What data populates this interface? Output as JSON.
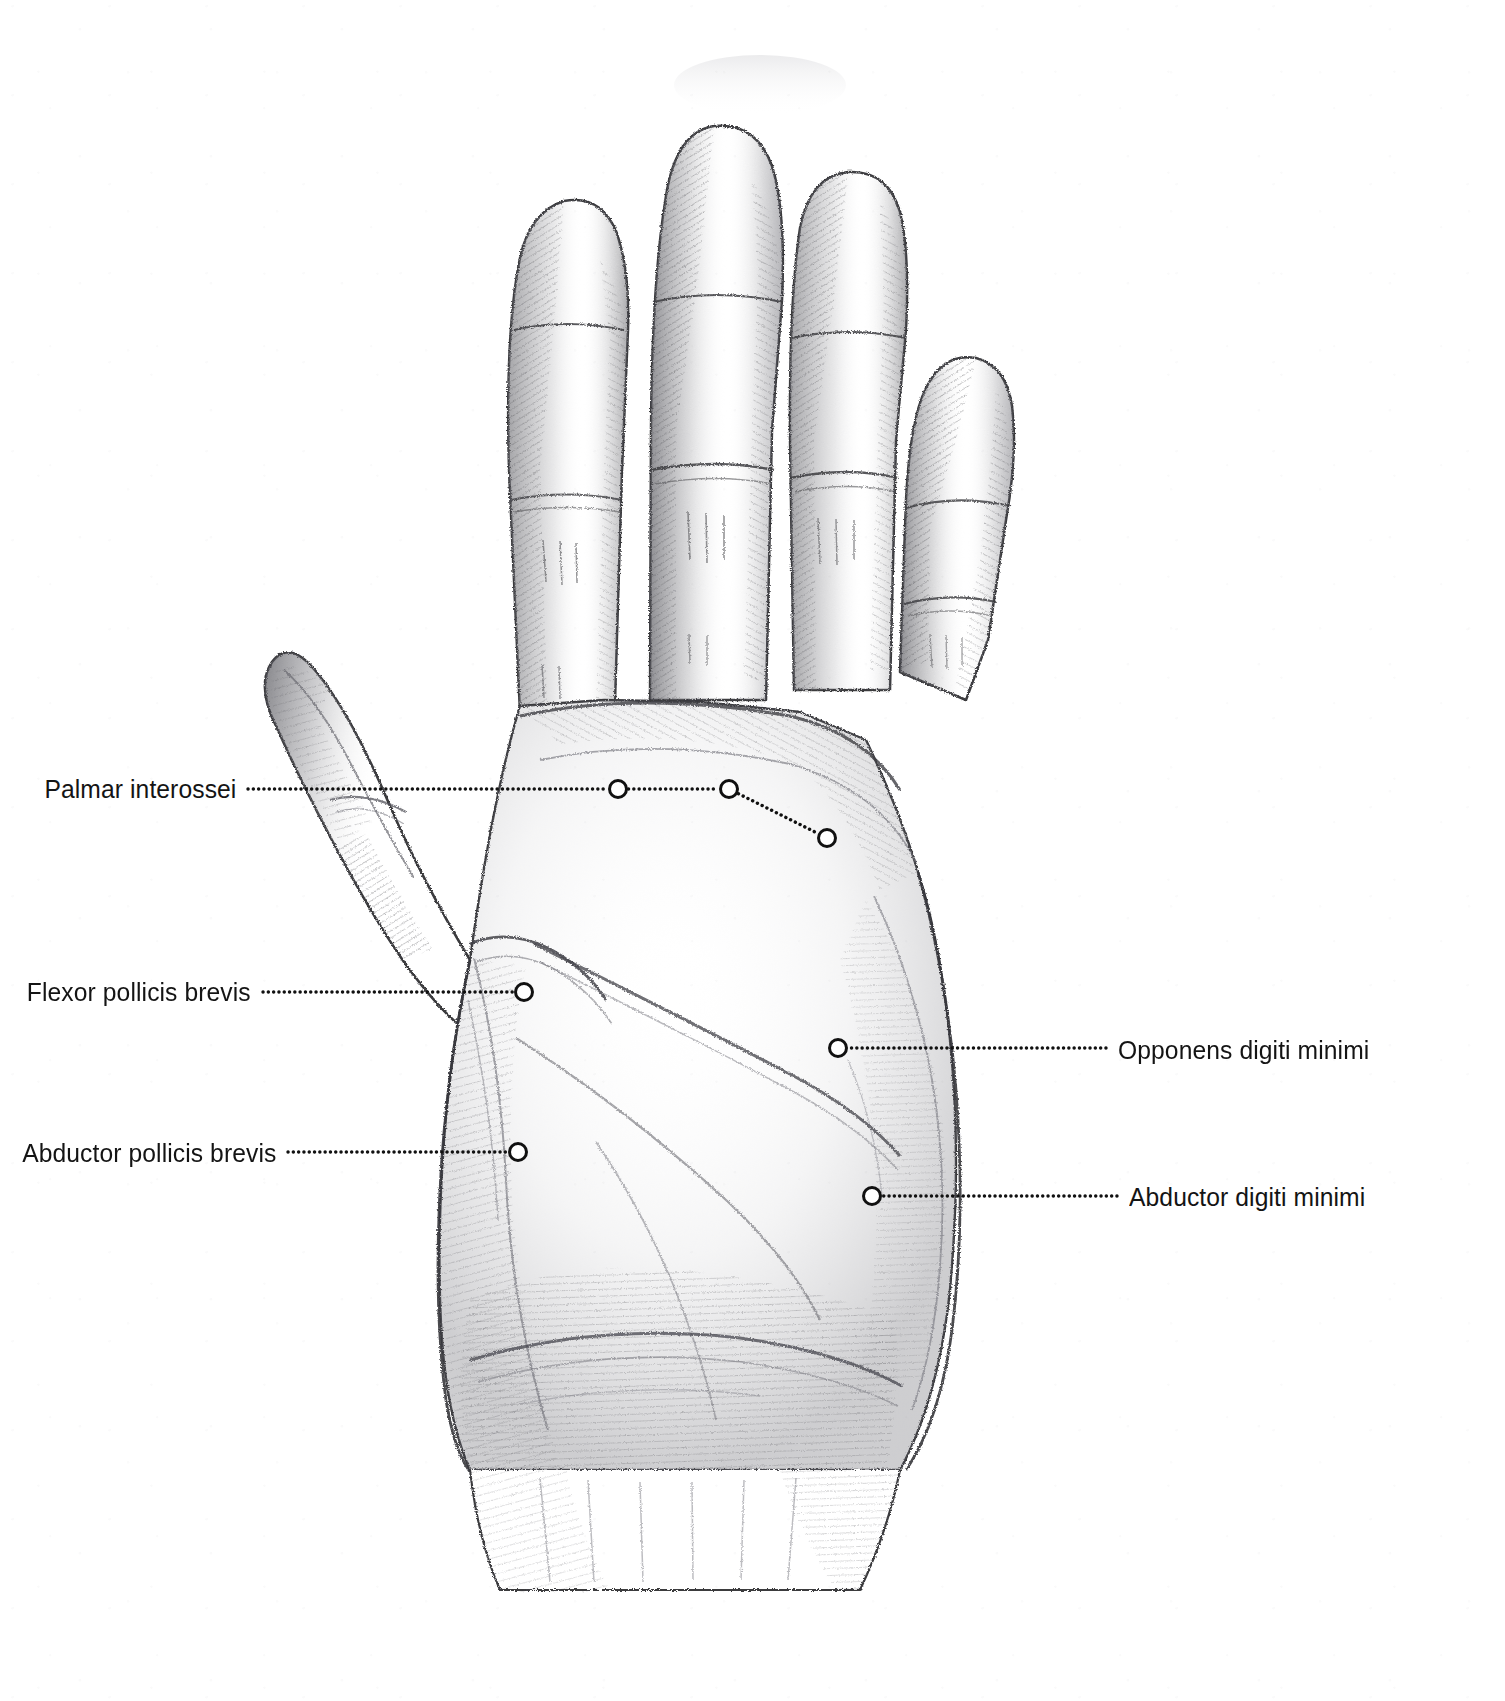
{
  "figure": {
    "medium": "graphite pencil drawing",
    "background_color": "#ffffff",
    "ink_color": "#141414",
    "pencil_color": "#6b6b6e",
    "width": 1505,
    "height": 1701
  },
  "callouts": [
    {
      "id": "palmar-interossei",
      "label": "Palmar interossei",
      "side": "left",
      "text_anchor_x": 236,
      "text_baseline_y": 797,
      "leader_start_x": 248,
      "leader_y": 789,
      "markers": [
        {
          "x": 618,
          "y": 789
        },
        {
          "x": 729,
          "y": 789
        },
        {
          "x": 827,
          "y": 838
        }
      ]
    },
    {
      "id": "flexor-pollicis-brevis",
      "label": "Flexor pollicis brevis",
      "side": "left",
      "text_anchor_x": 251,
      "text_baseline_y": 1000,
      "leader_start_x": 263,
      "leader_y": 992,
      "markers": [
        {
          "x": 524,
          "y": 992
        }
      ]
    },
    {
      "id": "abductor-pollicis-brevis",
      "label": "Abductor pollicis brevis",
      "side": "left",
      "text_anchor_x": 276,
      "text_baseline_y": 1161,
      "leader_start_x": 288,
      "leader_y": 1152,
      "markers": [
        {
          "x": 518,
          "y": 1152
        }
      ]
    },
    {
      "id": "opponens-digiti-minimi",
      "label": "Opponens digiti minimi",
      "side": "right",
      "text_anchor_x": 1118,
      "text_baseline_y": 1058,
      "leader_start_x": 1106,
      "leader_y": 1048,
      "markers": [
        {
          "x": 838,
          "y": 1048
        }
      ]
    },
    {
      "id": "abductor-digiti-minimi",
      "label": "Abductor digiti minimi",
      "side": "right",
      "text_anchor_x": 1129,
      "text_baseline_y": 1205,
      "leader_start_x": 1117,
      "leader_y": 1196,
      "markers": [
        {
          "x": 872,
          "y": 1196
        }
      ]
    }
  ],
  "marker_style": {
    "shape": "open-circle",
    "radius": 8.5,
    "stroke_width": 3,
    "fill": "#ffffff",
    "stroke": "#111111"
  },
  "leader_style": {
    "shape": "dotted-line",
    "dot_diameter": 3.4,
    "gap": 5.2,
    "color": "#111111"
  }
}
